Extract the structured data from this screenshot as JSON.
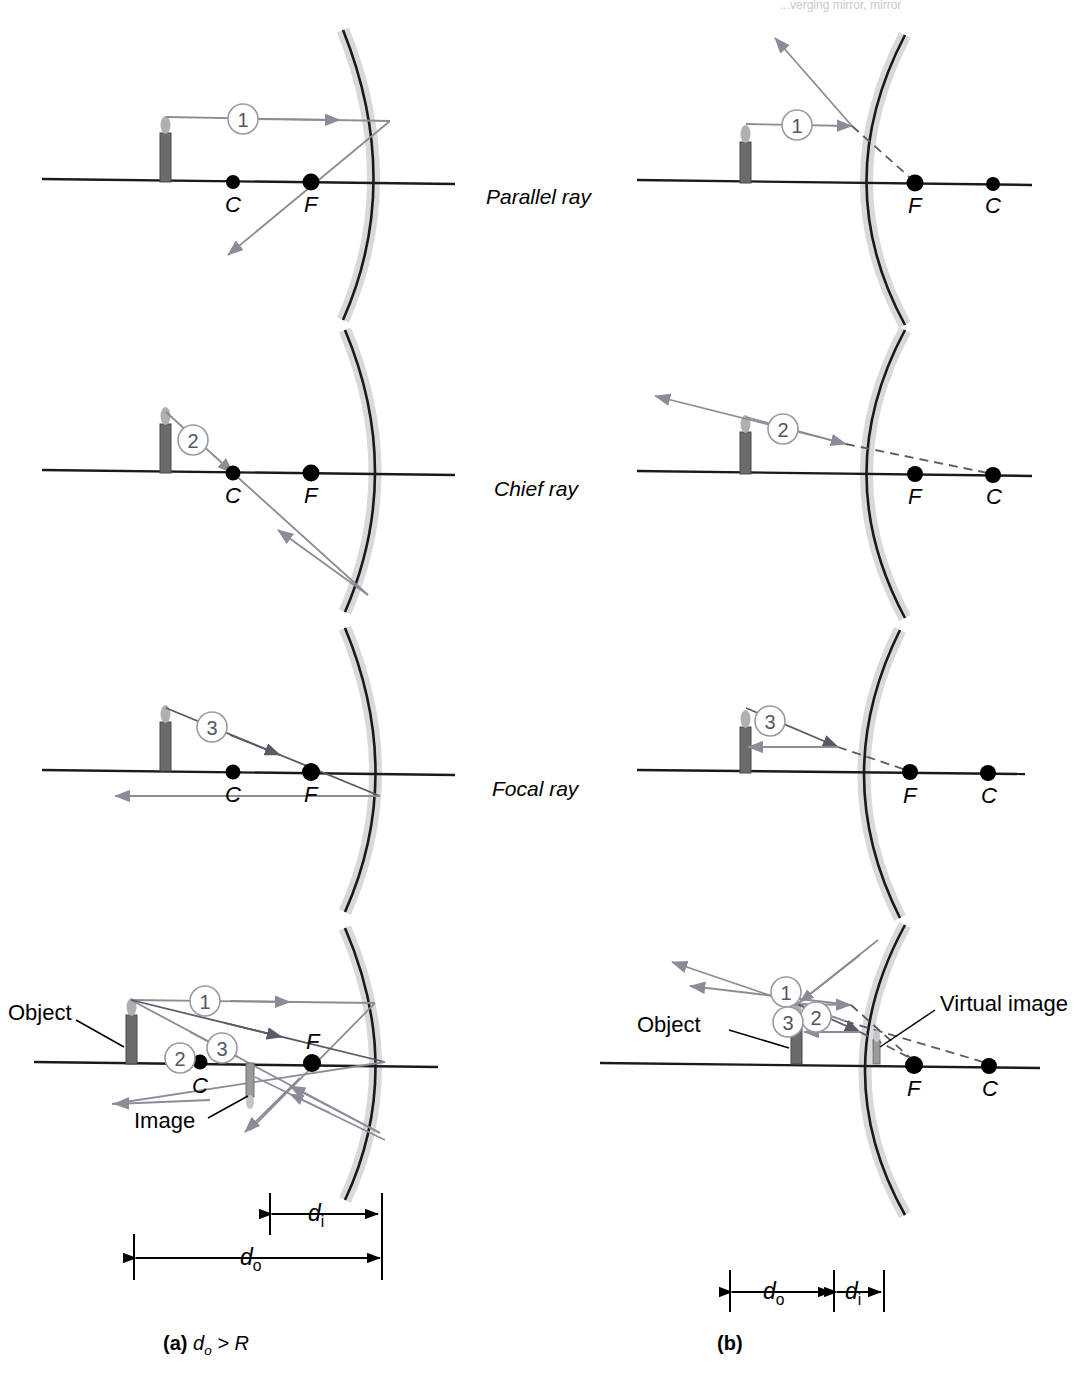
{
  "figure": {
    "top_note": "...verging mirror, mirror",
    "center_labels": [
      {
        "text": "Parallel ray",
        "x": 486,
        "y": 196
      },
      {
        "text": "Chief ray",
        "x": 494,
        "y": 487
      },
      {
        "text": "Focal ray",
        "x": 492,
        "y": 787
      }
    ],
    "captions": [
      {
        "id": "a",
        "bold": "(a)",
        "rest": "d",
        "sub": "o",
        "tail": " > R",
        "x": 163,
        "y": 1332
      },
      {
        "id": "b",
        "bold": "(b)",
        "rest": "",
        "sub": "",
        "tail": "",
        "x": 717,
        "y": 1332
      }
    ],
    "point_labels": {
      "center": "C",
      "focus": "F"
    },
    "ray_numbers": [
      "1",
      "2",
      "3"
    ],
    "annotations": {
      "object": "Object",
      "image": "Image",
      "virtual_image": "Virtual image",
      "d_o": "d",
      "d_o_sub": "o",
      "d_i": "d",
      "d_i_sub": "i"
    },
    "colors": {
      "axis": "#1a1a1a",
      "mirror": "#1a1a1a",
      "mirror_shade": "#d9d9d9",
      "ray": "#8c8c99",
      "ray_dark": "#5a5a68",
      "candle_body": "#6b6b6b",
      "candle_flame": "#b0b0b0",
      "point": "#000000",
      "leader": "#000000"
    },
    "columns": {
      "left": {
        "type": "concave",
        "mirror_x": 390,
        "candle_x": 165,
        "C_x": 233,
        "F_x": 311
      },
      "right": {
        "type": "convex",
        "mirror_x": 848,
        "candle_x": 745,
        "F_x": 915,
        "C_x": 993
      }
    },
    "rows": [
      {
        "name": "parallel-ray",
        "axis_y": 182
      },
      {
        "name": "chief-ray",
        "axis_y": 473
      },
      {
        "name": "focal-ray",
        "axis_y": 773
      },
      {
        "name": "ray-diagram",
        "axis_y": 1065
      }
    ]
  }
}
